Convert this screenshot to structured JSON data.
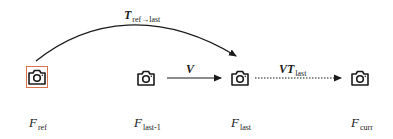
{
  "nodes": [
    {
      "id": "ref",
      "symbol": "F",
      "subscript": "ref",
      "highlighted": true,
      "highlight_color": "#d9734e"
    },
    {
      "id": "last-1",
      "symbol": "F",
      "subscript": "last-1",
      "highlighted": false
    },
    {
      "id": "last",
      "symbol": "F",
      "subscript": "last",
      "highlighted": false
    },
    {
      "id": "curr",
      "symbol": "F",
      "subscript": "curr",
      "highlighted": false
    }
  ],
  "edges": [
    {
      "from": "ref",
      "to": "last",
      "label_main": "T",
      "label_sub": "ref→last",
      "style": "solid-curved"
    },
    {
      "from": "last-1",
      "to": "last",
      "label_main": "V",
      "label_sub": "",
      "style": "solid"
    },
    {
      "from": "last",
      "to": "curr",
      "label_main": "VT",
      "label_sub": "last",
      "style": "dotted"
    }
  ],
  "colors": {
    "stroke": "#1a1a1a",
    "highlight": "#d9734e"
  }
}
